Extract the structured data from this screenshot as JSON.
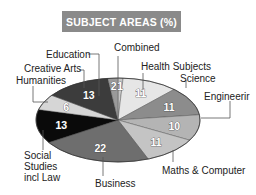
{
  "chart_data": {
    "type": "pie",
    "title": "SUBJECT AREAS (%)",
    "categories": [
      "Combined",
      "Health Subjects",
      "Science",
      "Engineering",
      "Maths & Computer",
      "Business",
      "Social Studies incl Law",
      "Humanities",
      "Creative Arts",
      "Education"
    ],
    "values": [
      1,
      11,
      11,
      10,
      11,
      22,
      13,
      6,
      13,
      2
    ],
    "colors": [
      "#c8c8c8",
      "#e6e6e6",
      "#8c8c8c",
      "#b4b4b4",
      "#c4c4c4",
      "#6e6e6e",
      "#0a0a0a",
      "#d6d6d6",
      "#3c3c3c",
      "#9a9a9a"
    ],
    "value_labels": [
      "1",
      "11",
      "11",
      "10",
      "11",
      "22",
      "13",
      "6",
      "13",
      "2"
    ],
    "display_labels": [
      "Combined",
      "Health Subjects",
      "Science",
      "Engineerir",
      "Maths & Computer",
      "Business",
      "Social\nStudies\nincl Law",
      "Humanities",
      "Creative Arts",
      "Education"
    ],
    "start_angle_deg": 0,
    "direction": "clockwise",
    "legend": "none",
    "unit": "%"
  },
  "title": "SUBJECT AREAS (%)",
  "labels": {
    "combined": "Combined",
    "health": "Health Subjects",
    "science": "Science",
    "engineering": "Engineerir",
    "maths": "Maths & Computer",
    "business": "Business",
    "social_1": "Social",
    "social_2": "Studies",
    "social_3": "incl Law",
    "humanities": "Humanities",
    "creative": "Creative Arts",
    "education": "Education"
  }
}
